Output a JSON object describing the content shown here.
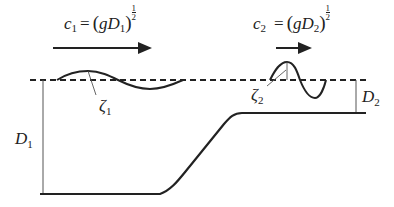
{
  "diagram": {
    "colors": {
      "line": "#222222",
      "thin_line": "#555555",
      "background": "#ffffff"
    },
    "labels": {
      "c1": {
        "lhs": "c",
        "lhs_sub": "1",
        "eq": "=",
        "open": "(",
        "g": "g",
        "D": "D",
        "D_sub": "1",
        "close": ")",
        "exp_num": "1",
        "exp_den": "2"
      },
      "c2": {
        "lhs": "c",
        "lhs_sub": "2",
        "eq": "=",
        "open": "(",
        "g": "g",
        "D": "D",
        "D_sub": "2",
        "close": ")",
        "exp_num": "1",
        "exp_den": "2"
      },
      "zeta1": {
        "sym": "ζ",
        "sub": "1"
      },
      "zeta2": {
        "sym": "ζ",
        "sub": "2"
      },
      "D1": {
        "sym": "D",
        "sub": "1"
      },
      "D2": {
        "sym": "D",
        "sub": "2"
      }
    },
    "elements": {
      "still_water_level": "dashed line",
      "wave1": "low-amplitude long wave in deep region",
      "wave2": "higher-amplitude short wave in shallow region",
      "arrow1": "propagation direction, long arrow",
      "arrow2": "propagation direction, short arrow",
      "bottom": "deep flat bed, sloping ramp, shallow shelf"
    }
  }
}
